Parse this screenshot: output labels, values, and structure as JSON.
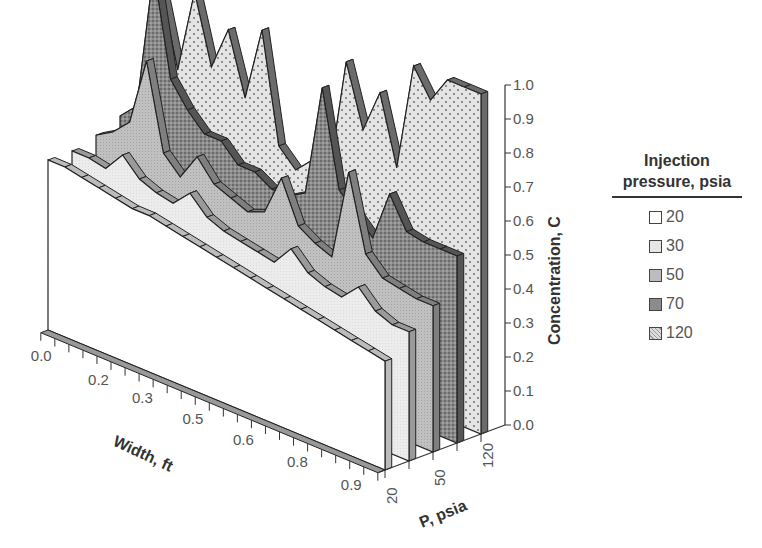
{
  "chart_data": {
    "type": "area",
    "subtype": "3d-ribbon",
    "title": "",
    "xlabel": "Width, ft",
    "ylabel": "P, psia",
    "zlabel": "Concentration, C",
    "x_tick_labels": [
      "0.0",
      "0.2",
      "0.3",
      "0.5",
      "0.6",
      "0.8",
      "0.9"
    ],
    "y_tick_labels": [
      "20",
      "50",
      "120"
    ],
    "z_tick_labels": [
      "0.0",
      "0.1",
      "0.2",
      "0.3",
      "0.4",
      "0.5",
      "0.6",
      "0.7",
      "0.8",
      "0.9",
      "1.0"
    ],
    "zlim": [
      0,
      1.0
    ],
    "legend": {
      "title_line1": "Injection",
      "title_line2": "pressure, psia",
      "position": "right"
    },
    "x": [
      0.0,
      0.05,
      0.1,
      0.15,
      0.2,
      0.25,
      0.3,
      0.35,
      0.4,
      0.45,
      0.5,
      0.55,
      0.6,
      0.65,
      0.7,
      0.75,
      0.8,
      0.85,
      0.9,
      0.95,
      1.0
    ],
    "series": [
      {
        "name": "20",
        "fill": "#ffffff",
        "values": [
          0.5,
          0.5,
          0.49,
          0.48,
          0.47,
          0.46,
          0.46,
          0.45,
          0.44,
          0.43,
          0.42,
          0.41,
          0.4,
          0.39,
          0.38,
          0.37,
          0.36,
          0.35,
          0.34,
          0.33,
          0.32
        ]
      },
      {
        "name": "30",
        "fill": "#e8e8e8",
        "values": [
          0.5,
          0.5,
          0.49,
          0.55,
          0.5,
          0.48,
          0.47,
          0.52,
          0.47,
          0.45,
          0.44,
          0.43,
          0.42,
          0.48,
          0.43,
          0.41,
          0.4,
          0.45,
          0.4,
          0.38,
          0.38
        ]
      },
      {
        "name": "50",
        "fill": "#bdbdbd",
        "values": [
          0.52,
          0.55,
          0.6,
          0.8,
          0.55,
          0.5,
          0.58,
          0.52,
          0.5,
          0.48,
          0.5,
          0.62,
          0.5,
          0.47,
          0.45,
          0.72,
          0.5,
          0.45,
          0.44,
          0.43,
          0.43
        ]
      },
      {
        "name": "70",
        "fill": "#8c8c8c",
        "values": [
          0.55,
          0.6,
          1.02,
          0.72,
          0.65,
          0.6,
          0.6,
          0.55,
          0.55,
          0.52,
          0.52,
          0.55,
          0.88,
          0.6,
          0.55,
          0.5,
          0.65,
          0.56,
          0.55,
          0.55,
          0.55
        ]
      },
      {
        "name": "120",
        "fill": "#dedede",
        "values": [
          0.7,
          0.92,
          0.7,
          0.95,
          0.75,
          0.88,
          0.7,
          0.92,
          0.6,
          0.55,
          0.6,
          0.58,
          0.93,
          0.75,
          0.88,
          0.68,
          1.0,
          0.92,
          1.0,
          1.0,
          1.0
        ]
      }
    ]
  }
}
